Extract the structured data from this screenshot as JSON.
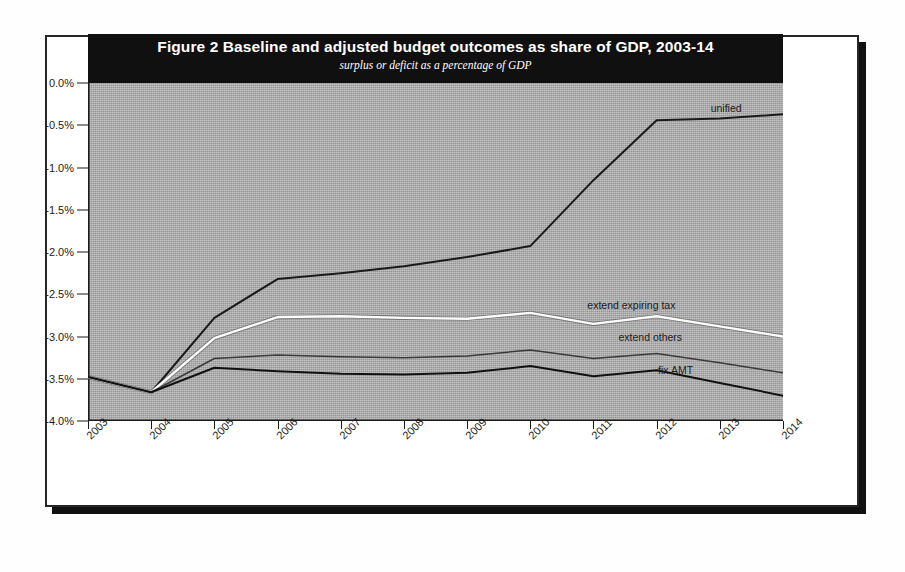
{
  "figure": {
    "title": "Figure 2 Baseline and adjusted budget outcomes as share of GDP, 2003-14",
    "subtitle": "surplus or deficit as a percentage of GDP"
  },
  "chart_data": {
    "type": "line",
    "title": "Figure 2 Baseline and adjusted budget outcomes as share of GDP, 2003-14",
    "subtitle": "surplus or deficit as a percentage of GDP",
    "xlabel": "",
    "ylabel": "",
    "x": [
      2003,
      2004,
      2005,
      2006,
      2007,
      2008,
      2009,
      2010,
      2011,
      2012,
      2013,
      2014
    ],
    "categories": [
      "2003",
      "2004",
      "2005",
      "2006",
      "2007",
      "2008",
      "2009",
      "2010",
      "2011",
      "2012",
      "2013",
      "2014"
    ],
    "ytick_labels": [
      "0.0%",
      "-0.5%",
      "-1.0%",
      "-1.5%",
      "-2.0%",
      "-2.5%",
      "-3.0%",
      "-3.5%",
      "-4.0%"
    ],
    "ytick_values": [
      0.0,
      -0.5,
      -1.0,
      -1.5,
      -2.0,
      -2.5,
      -3.0,
      -3.5,
      -4.0
    ],
    "ylim": [
      -4.0,
      0.0
    ],
    "xlim": [
      2003,
      2014
    ],
    "grid": false,
    "legend_position": "inline-right-of-series",
    "series": [
      {
        "name": "unified",
        "color": "#1a1a1a",
        "label_x": 2013.1,
        "label_y": -0.3,
        "values": [
          -3.48,
          -3.66,
          -2.78,
          -2.32,
          -2.25,
          -2.17,
          -2.06,
          -1.93,
          -1.15,
          -0.44,
          -0.42,
          -0.37
        ]
      },
      {
        "name": "extend expiring tax",
        "color": "#fdfdfd",
        "label_x": 2011.6,
        "label_y": -2.63,
        "values": [
          -3.48,
          -3.66,
          -3.02,
          -2.77,
          -2.76,
          -2.78,
          -2.79,
          -2.72,
          -2.85,
          -2.76,
          -2.88,
          -3.0
        ]
      },
      {
        "name": "extend others",
        "color": "#3a3a3a",
        "label_x": 2011.9,
        "label_y": -3.0,
        "values": [
          -3.48,
          -3.66,
          -3.26,
          -3.22,
          -3.24,
          -3.25,
          -3.23,
          -3.16,
          -3.26,
          -3.2,
          -3.31,
          -3.43
        ]
      },
      {
        "name": "fix AMT",
        "color": "#111111",
        "label_x": 2012.3,
        "label_y": -3.4,
        "values": [
          -3.48,
          -3.66,
          -3.37,
          -3.41,
          -3.44,
          -3.45,
          -3.43,
          -3.35,
          -3.47,
          -3.4,
          -3.55,
          -3.7
        ]
      }
    ]
  }
}
